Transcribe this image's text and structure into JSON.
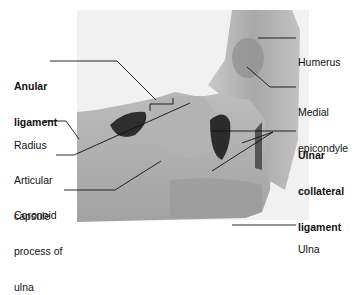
{
  "figure": {
    "colors": {
      "background": "#ffffff",
      "photo_backdrop": "#f1f1f1",
      "specimen_light": "#b9b9b9",
      "specimen_mid": "#9d9d9d",
      "specimen_dark": "#5a5a5a",
      "cavity": "#2b2b2b",
      "leader_line": "#111111",
      "text": "#111111"
    },
    "labels": [
      {
        "id": "anular-ligament",
        "line1": "Anular",
        "line2": "ligament",
        "bold": true
      },
      {
        "id": "radius",
        "line1": "Radius",
        "bold": false
      },
      {
        "id": "articular-capsule",
        "line1": "Articular",
        "line2": "capsule",
        "bold": false
      },
      {
        "id": "coronoid-process",
        "line1": "Coronoid",
        "line2": "process of",
        "line3": "ulna",
        "bold": false
      },
      {
        "id": "humerus",
        "line1": "Humerus",
        "bold": false
      },
      {
        "id": "medial-epicondyle",
        "line1": "Medial",
        "line2": "epicondyle",
        "bold": false
      },
      {
        "id": "ulnar-collateral-ligament",
        "line1": "Ulnar",
        "line2": "collateral",
        "line3": "ligament",
        "bold": true
      },
      {
        "id": "ulna",
        "line1": "Ulna",
        "bold": false
      }
    ]
  }
}
